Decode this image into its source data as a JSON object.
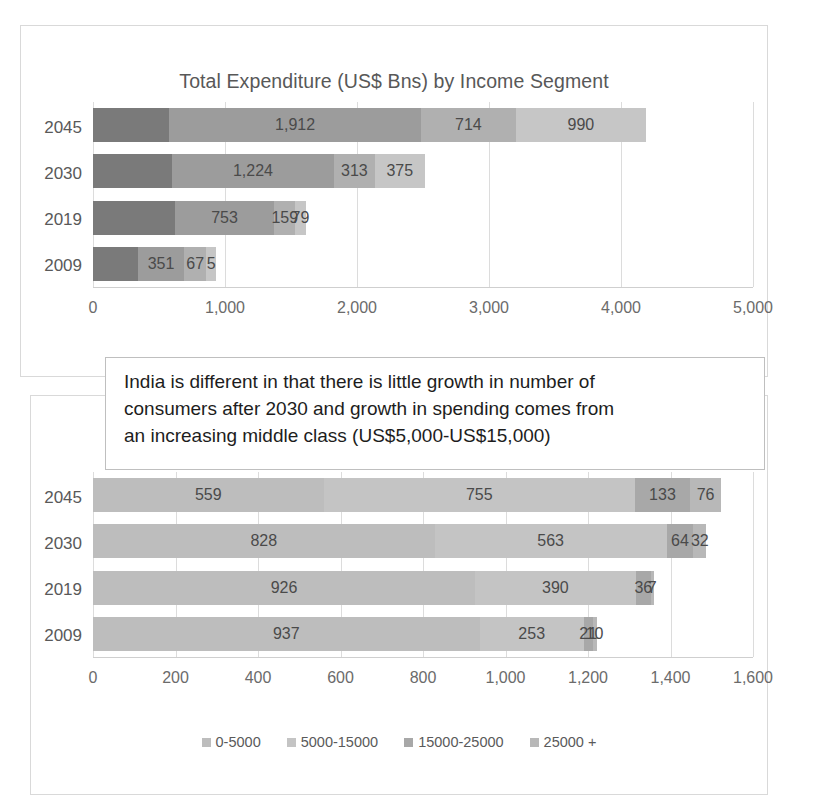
{
  "callout": {
    "line1": "India is different in that there is little growth in number of",
    "line2": "consumers after 2030 and growth in spending comes from",
    "line3": "an increasing middle class (US$5,000-US$15,000)"
  },
  "legend_labels": [
    "0-5000",
    "5000-15000",
    "15000-25000",
    "25000 +"
  ],
  "palette": {
    "chart1": [
      "#7a7a7a",
      "#9c9c9c",
      "#b0b0b0",
      "#c6c6c6"
    ],
    "chart2": [
      "#bdbdbd",
      "#c4c4c4",
      "#a8a8a8",
      "#b8b8b8"
    ]
  },
  "chart_data": [
    {
      "type": "bar",
      "orientation": "horizontal",
      "stacked": true,
      "title": "Total Expenditure (US$ Bns) by Income Segment",
      "xlabel": "",
      "ylabel": "",
      "xlim": [
        0,
        5000
      ],
      "xticks": [
        0,
        1000,
        2000,
        3000,
        4000,
        5000
      ],
      "xtick_labels": [
        "0",
        "1,000",
        "2,000",
        "3,000",
        "4,000",
        "5,000"
      ],
      "categories": [
        "2045",
        "2030",
        "2019",
        "2009"
      ],
      "grid": true,
      "legend_position": "bottom",
      "series": [
        {
          "name": "0-5000",
          "values": [
            575,
            600,
            620,
            340
          ]
        },
        {
          "name": "5000-15000",
          "values": [
            1912,
            1224,
            753,
            351
          ]
        },
        {
          "name": "15000-25000",
          "values": [
            714,
            313,
            159,
            167
          ]
        },
        {
          "name": "25000 +",
          "values": [
            990,
            375,
            79,
            75
          ]
        }
      ],
      "labels": {
        "2045": [
          "",
          "1,912",
          "714",
          "990"
        ],
        "2030": [
          "",
          "1,224",
          "313",
          "375"
        ],
        "2019": [
          "",
          "753",
          "159",
          "79"
        ],
        "2009": [
          "",
          "351",
          "67",
          "5"
        ]
      }
    },
    {
      "type": "bar",
      "orientation": "horizontal",
      "stacked": true,
      "title": "Persons Mns by Income Segment",
      "xlabel": "",
      "ylabel": "",
      "xlim": [
        0,
        1600
      ],
      "xticks": [
        0,
        200,
        400,
        600,
        800,
        1000,
        1200,
        1400,
        1600
      ],
      "xtick_labels": [
        "0",
        "200",
        "400",
        "600",
        "800",
        "1,000",
        "1,200",
        "1,400",
        "1,600"
      ],
      "categories": [
        "2045",
        "2030",
        "2019",
        "2009"
      ],
      "grid": true,
      "legend_position": "bottom",
      "series": [
        {
          "name": "0-5000",
          "values": [
            559,
            828,
            926,
            937
          ]
        },
        {
          "name": "5000-15000",
          "values": [
            755,
            563,
            390,
            253
          ]
        },
        {
          "name": "15000-25000",
          "values": [
            133,
            64,
            36,
            21
          ]
        },
        {
          "name": "25000 +",
          "values": [
            76,
            32,
            7,
            10
          ]
        }
      ],
      "labels": {
        "2045": [
          "559",
          "755",
          "133",
          "76"
        ],
        "2030": [
          "828",
          "563",
          "64",
          "32"
        ],
        "2019": [
          "926",
          "390",
          "36",
          "7"
        ],
        "2009": [
          "937",
          "253",
          "21",
          "10"
        ]
      }
    }
  ]
}
